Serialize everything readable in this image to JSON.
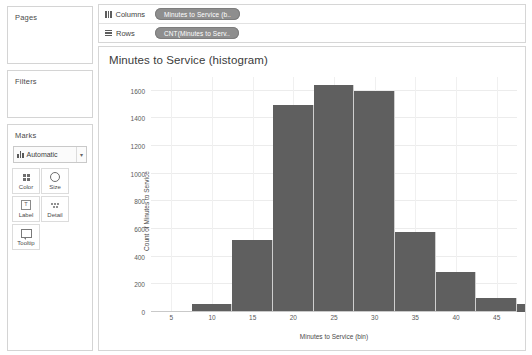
{
  "sidebar": {
    "pages": {
      "title": "Pages"
    },
    "filters": {
      "title": "Filters"
    },
    "marks": {
      "title": "Marks",
      "mark_type": "Automatic",
      "caret": "▾",
      "buttons": [
        {
          "label": "Color",
          "icon": "color-icon"
        },
        {
          "label": "Size",
          "icon": "size-icon"
        },
        {
          "label": "Label",
          "icon": "label-icon",
          "glyph": "T"
        },
        {
          "label": "Detail",
          "icon": "detail-icon"
        },
        {
          "label": "Tooltip",
          "icon": "tooltip-icon"
        }
      ]
    }
  },
  "shelves": {
    "columns": {
      "label": "Columns",
      "pill": "Minutes to Service (b.."
    },
    "rows": {
      "label": "Rows",
      "pill": "CNT(Minutes to Serv.."
    }
  },
  "viz": {
    "title": "Minutes to Service (histogram)"
  },
  "colors": {
    "bar": "#5f5f5f",
    "pill": "#8e8e8e",
    "grid": "#ececec",
    "border": "#d6d6d6"
  },
  "chart_data": {
    "type": "bar",
    "title": "Minutes to Service (histogram)",
    "xlabel": "Minutes to Service (bin)",
    "ylabel": "Count of Minutes to Service",
    "xlim": [
      2.5,
      47.5
    ],
    "ylim": [
      0,
      1700
    ],
    "bin_width": 5,
    "grid": true,
    "legend": "none",
    "x_ticks": [
      5,
      10,
      15,
      20,
      25,
      30,
      35,
      40,
      45
    ],
    "y_ticks": [
      0,
      200,
      400,
      600,
      800,
      1000,
      1200,
      1400,
      1600
    ],
    "categories": [
      "7.5",
      "12.5",
      "17.5",
      "22.5",
      "27.5",
      "32.5",
      "37.5",
      "42.5",
      "47.5"
    ],
    "bin_starts": [
      7.5,
      12.5,
      17.5,
      22.5,
      27.5,
      32.5,
      37.5,
      42.5,
      47.5
    ],
    "values": [
      60,
      520,
      1500,
      1640,
      1600,
      580,
      290,
      100,
      60
    ]
  }
}
